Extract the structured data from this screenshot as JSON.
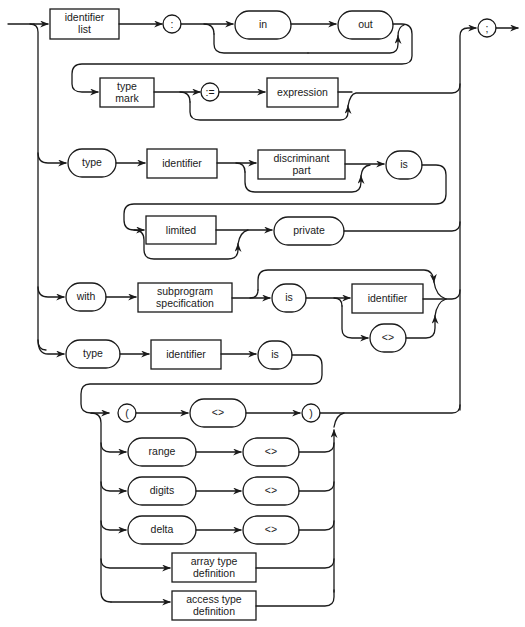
{
  "diagram": {
    "title": "",
    "kind": "syntax-diagram",
    "nodes": {
      "identifier_list": [
        "identifier",
        "list"
      ],
      "colon": ":",
      "in": "in",
      "out": "out",
      "type_mark": [
        "type",
        "mark"
      ],
      "assign": ":=",
      "expression": "expression",
      "semicolon": ";",
      "type1": "type",
      "identifier1": "identifier",
      "discriminant_part": [
        "discriminant",
        "part"
      ],
      "is1": "is",
      "limited": "limited",
      "private": "private",
      "with": "with",
      "subprogram_specification": [
        "subprogram",
        "specification"
      ],
      "is2": "is",
      "identifier2": "identifier",
      "box_op1": "<>",
      "type2": "type",
      "identifier3": "identifier",
      "is3": "is",
      "lparen": "(",
      "box_op2": "<>",
      "rparen": ")",
      "range": "range",
      "box_op3": "<>",
      "digits": "digits",
      "box_op4": "<>",
      "delta": "delta",
      "box_op5": "<>",
      "array_type_definition": [
        "array type",
        "definition"
      ],
      "access_type_definition": [
        "access type",
        "definition"
      ]
    },
    "colors": {
      "line": "#1a1a1a",
      "background": "#ffffff"
    }
  }
}
